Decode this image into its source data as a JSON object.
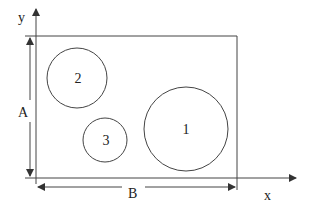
{
  "diagram": {
    "colors": {
      "stroke": "#444444",
      "text": "#222222",
      "background": "#ffffff"
    },
    "axes": {
      "x_label": "x",
      "y_label": "y"
    },
    "dimensions": {
      "height_label": "A",
      "width_label": "B"
    },
    "circles": [
      {
        "label": "1",
        "cx": 186,
        "cy": 129,
        "r": 42
      },
      {
        "label": "2",
        "cx": 77,
        "cy": 78,
        "r": 30
      },
      {
        "label": "3",
        "cx": 105,
        "cy": 140,
        "r": 22
      }
    ]
  }
}
